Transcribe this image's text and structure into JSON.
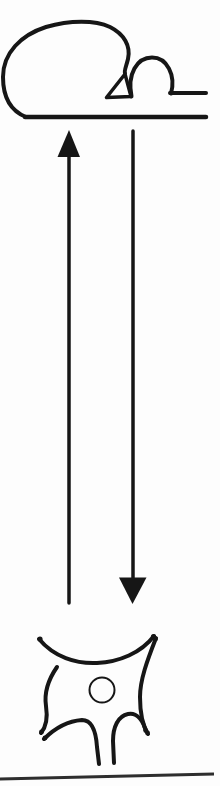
{
  "figure": {
    "kind": "hand-drawn-diagram",
    "elements": {
      "top_structure": "terminal-outline-with-notch-and-dome",
      "up_arrow": "arrow-up-icon",
      "down_arrow": "arrow-down-icon",
      "bottom_cell": "stellate-cell-with-nucleus",
      "bottom_rule": "horizontal-divider"
    }
  },
  "colors": {
    "ink": "#161616",
    "rule": "#2e2e2e",
    "background": "#fdfdfd",
    "paper": "#ffffff"
  }
}
